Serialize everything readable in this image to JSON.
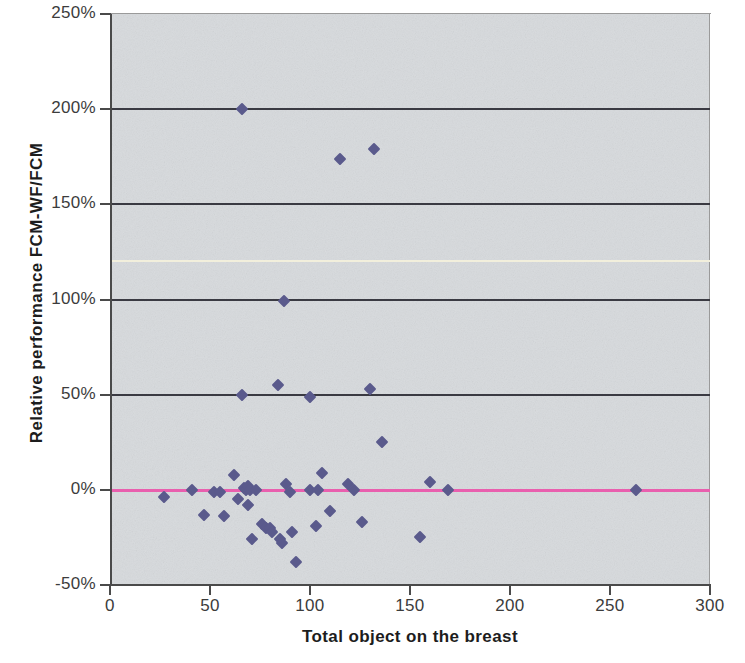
{
  "chart_data": {
    "type": "scatter",
    "title": "",
    "xlabel": "Total object on the breast",
    "ylabel": "Relative performance FCM-WF/FCM",
    "xlim": [
      0,
      300
    ],
    "ylim": [
      -50,
      250
    ],
    "xticks": [
      0,
      50,
      100,
      150,
      200,
      250,
      300
    ],
    "xtick_labels": [
      "0",
      "50",
      "100",
      "150",
      "200",
      "250",
      "300"
    ],
    "yticks": [
      -50,
      0,
      50,
      100,
      150,
      200,
      250
    ],
    "ytick_labels": [
      "-50%",
      "0%",
      "50%",
      "100%",
      "150%",
      "200%",
      "250%"
    ],
    "y_unit": "percent",
    "grid": true,
    "gridlines": [
      {
        "value": 200,
        "color": "#3a3a42",
        "style": "major"
      },
      {
        "value": 150,
        "color": "#3a3a42",
        "style": "major"
      },
      {
        "value": 120,
        "color": "#f2efdc",
        "style": "pale"
      },
      {
        "value": 100,
        "color": "#3a3a42",
        "style": "major"
      },
      {
        "value": 50,
        "color": "#3a3a42",
        "style": "major"
      },
      {
        "value": 0,
        "color": "#e95fae",
        "style": "zero"
      }
    ],
    "legend": null,
    "marker": {
      "shape": "diamond",
      "color": "#5a5a8c",
      "size": 9
    },
    "plot_background": "#d7dadd",
    "points": [
      {
        "x": 27,
        "y": -4
      },
      {
        "x": 41,
        "y": 0
      },
      {
        "x": 47,
        "y": -13
      },
      {
        "x": 52,
        "y": -1
      },
      {
        "x": 55,
        "y": -1
      },
      {
        "x": 57,
        "y": -14
      },
      {
        "x": 62,
        "y": 8
      },
      {
        "x": 64,
        "y": -5
      },
      {
        "x": 66,
        "y": 50
      },
      {
        "x": 66,
        "y": 200
      },
      {
        "x": 67,
        "y": 1
      },
      {
        "x": 68,
        "y": 0
      },
      {
        "x": 69,
        "y": 2
      },
      {
        "x": 69,
        "y": -8
      },
      {
        "x": 70,
        "y": 0
      },
      {
        "x": 71,
        "y": -26
      },
      {
        "x": 73,
        "y": 0
      },
      {
        "x": 76,
        "y": -18
      },
      {
        "x": 78,
        "y": -20
      },
      {
        "x": 80,
        "y": -20
      },
      {
        "x": 81,
        "y": -22
      },
      {
        "x": 84,
        "y": 55
      },
      {
        "x": 85,
        "y": -26
      },
      {
        "x": 86,
        "y": -28
      },
      {
        "x": 87,
        "y": 99
      },
      {
        "x": 88,
        "y": 3
      },
      {
        "x": 90,
        "y": -1
      },
      {
        "x": 91,
        "y": -22
      },
      {
        "x": 93,
        "y": -38
      },
      {
        "x": 100,
        "y": 49
      },
      {
        "x": 100,
        "y": 0
      },
      {
        "x": 103,
        "y": -19
      },
      {
        "x": 104,
        "y": 0
      },
      {
        "x": 106,
        "y": 9
      },
      {
        "x": 110,
        "y": -11
      },
      {
        "x": 115,
        "y": 174
      },
      {
        "x": 119,
        "y": 3
      },
      {
        "x": 122,
        "y": 0
      },
      {
        "x": 126,
        "y": -17
      },
      {
        "x": 130,
        "y": 53
      },
      {
        "x": 132,
        "y": 179
      },
      {
        "x": 136,
        "y": 25
      },
      {
        "x": 155,
        "y": -25
      },
      {
        "x": 160,
        "y": 4
      },
      {
        "x": 169,
        "y": 0
      },
      {
        "x": 263,
        "y": 0
      }
    ]
  }
}
